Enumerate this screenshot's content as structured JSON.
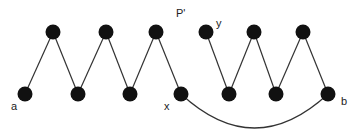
{
  "diagram": {
    "title_label": "P'",
    "nodes": [
      {
        "id": "a",
        "x": 25,
        "y": 94,
        "label": "a"
      },
      {
        "id": "t1",
        "x": 53,
        "y": 32
      },
      {
        "id": "b1",
        "x": 78,
        "y": 94
      },
      {
        "id": "t2",
        "x": 106,
        "y": 32
      },
      {
        "id": "b2",
        "x": 130,
        "y": 94
      },
      {
        "id": "t3",
        "x": 156,
        "y": 32
      },
      {
        "id": "x",
        "x": 181,
        "y": 94,
        "label": "x"
      },
      {
        "id": "y",
        "x": 206,
        "y": 32,
        "label": "y"
      },
      {
        "id": "b3",
        "x": 229,
        "y": 94
      },
      {
        "id": "t4",
        "x": 254,
        "y": 32
      },
      {
        "id": "b4",
        "x": 276,
        "y": 94
      },
      {
        "id": "t5",
        "x": 303,
        "y": 32
      },
      {
        "id": "b",
        "x": 328,
        "y": 94,
        "label": "b"
      }
    ],
    "edges": [
      [
        "a",
        "t1"
      ],
      [
        "t1",
        "b1"
      ],
      [
        "b1",
        "t2"
      ],
      [
        "t2",
        "b2"
      ],
      [
        "b2",
        "t3"
      ],
      [
        "t3",
        "x"
      ],
      [
        "y",
        "b3"
      ],
      [
        "b3",
        "t4"
      ],
      [
        "t4",
        "b4"
      ],
      [
        "b4",
        "t5"
      ],
      [
        "t5",
        "b"
      ]
    ],
    "curved_edges": [
      [
        "x",
        "b"
      ]
    ],
    "labels": {
      "a": "a",
      "x": "x",
      "y": "y",
      "b": "b"
    },
    "colors": {
      "node": "#111111",
      "edge": "#333333"
    }
  }
}
